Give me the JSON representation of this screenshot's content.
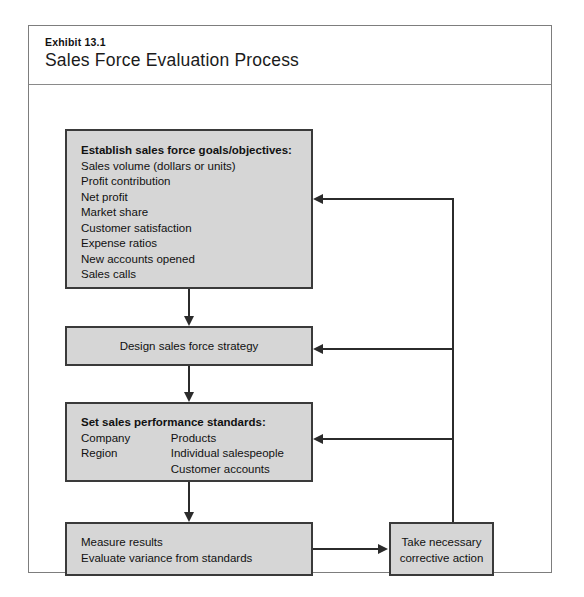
{
  "exhibit": {
    "label": "Exhibit 13.1",
    "title": "Sales Force Evaluation Process"
  },
  "diagram": {
    "type": "flowchart",
    "boxes": {
      "goals": {
        "heading": "Establish sales force goals/objectives:",
        "items": [
          "Sales volume (dollars or units)",
          "Profit contribution",
          "Net profit",
          "Market share",
          "Customer satisfaction",
          "Expense ratios",
          "New accounts opened",
          "Sales calls"
        ]
      },
      "strategy": {
        "label": "Design sales force strategy"
      },
      "standards": {
        "heading": "Set sales performance standards:",
        "left_items": [
          "Company",
          "Region"
        ],
        "right_items": [
          "Products",
          "Individual salespeople",
          "Customer accounts"
        ]
      },
      "measure": {
        "line1": "Measure results",
        "line2": "Evaluate variance from standards"
      },
      "corrective": {
        "line1": "Take necessary",
        "line2": "corrective action"
      }
    },
    "colors": {
      "box_fill": "#d6d6d6",
      "box_border": "#3a3a3a",
      "connector": "#2b2b2b",
      "frame_border": "#7d7d7d"
    }
  }
}
